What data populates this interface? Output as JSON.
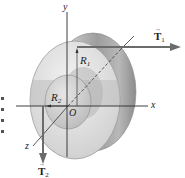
{
  "figure": {
    "type": "physics-diagram",
    "axes": {
      "x_label": "x",
      "y_label": "y",
      "z_label": "z",
      "origin_label": "O"
    },
    "radii": {
      "outer": {
        "symbol": "R",
        "subscript": "1"
      },
      "inner": {
        "symbol": "R",
        "subscript": "2"
      }
    },
    "forces": [
      {
        "symbol": "T",
        "subscript": "1",
        "vector_mark": "→",
        "direction": "+x"
      },
      {
        "symbol": "T",
        "subscript": "2",
        "vector_mark": "→",
        "direction": "-y"
      }
    ],
    "colors": {
      "axis": "#2a2a2a",
      "arrow": "#6b6b6b",
      "outer_face": "#d4d4d4",
      "outer_band": "#bdbdbd",
      "rim": "#9a9a9a",
      "hub": "#c8c8c8",
      "background": "#ffffff"
    }
  }
}
